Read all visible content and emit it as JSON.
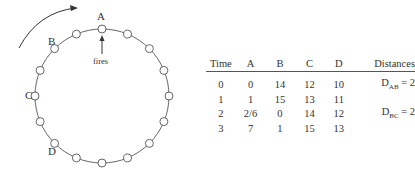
{
  "diagram": {
    "node_count": 16,
    "labels": {
      "A": "A",
      "B": "B",
      "C": "C",
      "D": "D"
    },
    "fires_label": "fires",
    "rotation_arrow": "clockwise"
  },
  "table": {
    "headers": [
      "Time",
      "A",
      "B",
      "C",
      "D",
      "Distances"
    ],
    "rows": [
      {
        "time": "0",
        "a": "0",
        "b": "14",
        "c": "12",
        "d": "10",
        "dist_main": "D",
        "dist_sub": "AB",
        "dist_val": " = 2"
      },
      {
        "time": "1",
        "a": "1",
        "b": "15",
        "c": "13",
        "d": "11",
        "dist_main": "",
        "dist_sub": "",
        "dist_val": ""
      },
      {
        "time": "2",
        "a": "2/6",
        "b": "0",
        "c": "14",
        "d": "12",
        "dist_main": "D",
        "dist_sub": "BC",
        "dist_val": " = 2"
      },
      {
        "time": "3",
        "a": "7",
        "b": "1",
        "c": "15",
        "d": "13",
        "dist_main": "",
        "dist_sub": "",
        "dist_val": ""
      }
    ]
  }
}
